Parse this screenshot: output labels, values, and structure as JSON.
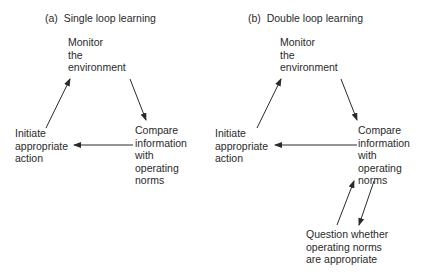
{
  "panels": [
    {
      "title": "(a)  Single loop learning",
      "nodes": {
        "monitor": "Monitor\nthe\nenvironment",
        "compare": "Compare\ninformation\nwith\noperating\nnorms",
        "initiate": "Initiate\nappropriate\naction"
      }
    },
    {
      "title": "(b)  Double loop learning",
      "nodes": {
        "monitor": "Monitor\nthe\nenvironment",
        "compare": "Compare\ninformation\nwith\noperating\nnorms",
        "initiate": "Initiate\nappropriate\naction",
        "question": "Question whether\noperating norms\nare appropriate"
      }
    }
  ],
  "colors": {
    "ink": "#2a2a2a",
    "background": "#ffffff"
  }
}
